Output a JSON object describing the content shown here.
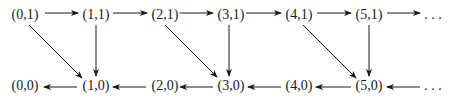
{
  "diagram": {
    "type": "directed-graph",
    "colors": {
      "stroke": "#1a1a1a",
      "background": "#ffffff"
    },
    "nodes": [
      {
        "id": "n01",
        "label": "(0,1)",
        "x": 25,
        "y": 15
      },
      {
        "id": "n11",
        "label": "(1,1)",
        "x": 96,
        "y": 15
      },
      {
        "id": "n21",
        "label": "(2,1)",
        "x": 165,
        "y": 15
      },
      {
        "id": "n31",
        "label": "(3,1)",
        "x": 231,
        "y": 15
      },
      {
        "id": "n41",
        "label": "(4,1)",
        "x": 299,
        "y": 15
      },
      {
        "id": "n51",
        "label": "(5,1)",
        "x": 369,
        "y": 15
      },
      {
        "id": "dots1",
        "label": ". . .",
        "x": 433,
        "y": 15
      },
      {
        "id": "n00",
        "label": "(0,0)",
        "x": 25,
        "y": 86
      },
      {
        "id": "n10",
        "label": "(1,0)",
        "x": 96,
        "y": 86
      },
      {
        "id": "n20",
        "label": "(2,0)",
        "x": 165,
        "y": 86
      },
      {
        "id": "n30",
        "label": "(3,0)",
        "x": 231,
        "y": 86
      },
      {
        "id": "n40",
        "label": "(4,0)",
        "x": 299,
        "y": 86
      },
      {
        "id": "n50",
        "label": "(5,0)",
        "x": 369,
        "y": 86
      },
      {
        "id": "dots0",
        "label": ". . .",
        "x": 433,
        "y": 86
      }
    ],
    "edges": [
      {
        "from": "n01",
        "to": "n11",
        "x1": 45,
        "y1": 13,
        "x2": 78,
        "y2": 13
      },
      {
        "from": "n11",
        "to": "n21",
        "x1": 113,
        "y1": 13,
        "x2": 147,
        "y2": 13
      },
      {
        "from": "n21",
        "to": "n31",
        "x1": 178,
        "y1": 13,
        "x2": 213,
        "y2": 13
      },
      {
        "from": "n31",
        "to": "n41",
        "x1": 246,
        "y1": 13,
        "x2": 281,
        "y2": 13
      },
      {
        "from": "n41",
        "to": "n51",
        "x1": 317,
        "y1": 13,
        "x2": 351,
        "y2": 13
      },
      {
        "from": "n51",
        "to": "dots1",
        "x1": 387,
        "y1": 13,
        "x2": 420,
        "y2": 13
      },
      {
        "from": "n10",
        "to": "n00",
        "x1": 77,
        "y1": 87,
        "x2": 44,
        "y2": 87
      },
      {
        "from": "n20",
        "to": "n10",
        "x1": 146,
        "y1": 87,
        "x2": 113,
        "y2": 87
      },
      {
        "from": "n30",
        "to": "n20",
        "x1": 213,
        "y1": 87,
        "x2": 180,
        "y2": 87
      },
      {
        "from": "n40",
        "to": "n30",
        "x1": 281,
        "y1": 87,
        "x2": 248,
        "y2": 87
      },
      {
        "from": "n50",
        "to": "n40",
        "x1": 351,
        "y1": 87,
        "x2": 316,
        "y2": 87
      },
      {
        "from": "dots0",
        "to": "n50",
        "x1": 420,
        "y1": 87,
        "x2": 387,
        "y2": 87
      },
      {
        "from": "n01",
        "to": "n10",
        "x1": 29,
        "y1": 25,
        "x2": 82,
        "y2": 78
      },
      {
        "from": "n11",
        "to": "n10",
        "x1": 96,
        "y1": 25,
        "x2": 96,
        "y2": 76
      },
      {
        "from": "n21",
        "to": "n30",
        "x1": 165,
        "y1": 25,
        "x2": 217,
        "y2": 77
      },
      {
        "from": "n31",
        "to": "n30",
        "x1": 229,
        "y1": 25,
        "x2": 229,
        "y2": 76
      },
      {
        "from": "n41",
        "to": "n50",
        "x1": 303,
        "y1": 25,
        "x2": 356,
        "y2": 78
      },
      {
        "from": "n51",
        "to": "n50",
        "x1": 369,
        "y1": 25,
        "x2": 369,
        "y2": 76
      }
    ]
  }
}
